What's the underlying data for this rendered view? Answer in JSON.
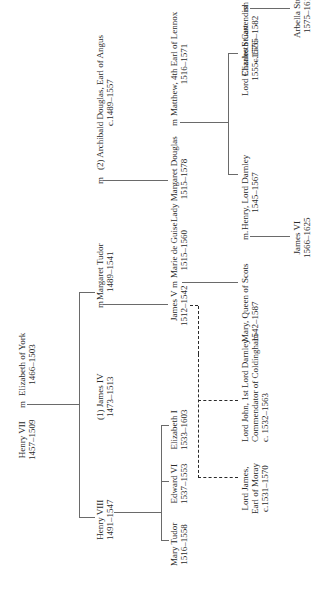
{
  "diagram": {
    "type": "family-tree",
    "orientation": "rotated-90-ccw",
    "people": {
      "henry_vii": {
        "name": "Henry VII",
        "dates": "1457–1509"
      },
      "elizabeth_york": {
        "name": "Elizabeth of York",
        "dates": "1466–1503"
      },
      "henry_viii": {
        "name": "Henry VIII",
        "dates": "1491–1547"
      },
      "james_iv": {
        "name": "(1) James IV",
        "dates": "1473–1513"
      },
      "margaret_tudor": {
        "name": "Margaret Tudor",
        "dates": "1489–1541"
      },
      "archibald_douglas": {
        "name": "(2) Archibald Douglas, Earl of Angus",
        "dates": "c.1489–1557"
      },
      "mary_tudor": {
        "name": "Mary Tudor",
        "dates": "1516–1558"
      },
      "edward_vi": {
        "name": "Edward VI",
        "dates": "1537–1553"
      },
      "elizabeth_i": {
        "name": "Elizabeth I",
        "dates": "1533–1603"
      },
      "james_v": {
        "name": "James V",
        "dates": "1512–1542"
      },
      "marie_de_guise": {
        "name": "Marie de Guise",
        "dates": "1515–1560"
      },
      "margaret_douglas": {
        "name": "Lady Margaret Douglas",
        "dates": "1515–1578"
      },
      "matthew_lennox": {
        "name": "Matthew, 4th Earl of Lennox",
        "dates": "1516–1571"
      },
      "lord_james": {
        "name_lines": [
          "Lord James,",
          "Earl of Moray"
        ],
        "dates": "c.1531–1570"
      },
      "lord_john": {
        "name_lines": [
          "Lord John,  1st Lord Darnley",
          "Commendator of Coldingham"
        ],
        "dates": "c. 1532–1563"
      },
      "mary_queen_scots": {
        "name": "Mary, Queen of Scots",
        "dates": "1542–1587"
      },
      "henry_darnley": {
        "name": "Henry, Lord Darnley",
        "dates": "1545–1567"
      },
      "charles_stuart": {
        "name": "Lord Charles Stuart",
        "dates": "1555–1576"
      },
      "elizabeth_cavendish": {
        "name": "Elizabeth Cavendish",
        "dates": "c.1555–1582"
      },
      "james_vi": {
        "name": "James VI",
        "dates": "1566–1625"
      },
      "arbella_stuart": {
        "name": "Arbella Stuart",
        "dates": "1575–1615"
      }
    },
    "marriage_marker": "m",
    "marriage_marker_alt": "m.",
    "line_color": "#6a6a6a",
    "dashed_line_color": "#2a2a2a",
    "text_color": "#2a2a2a"
  }
}
